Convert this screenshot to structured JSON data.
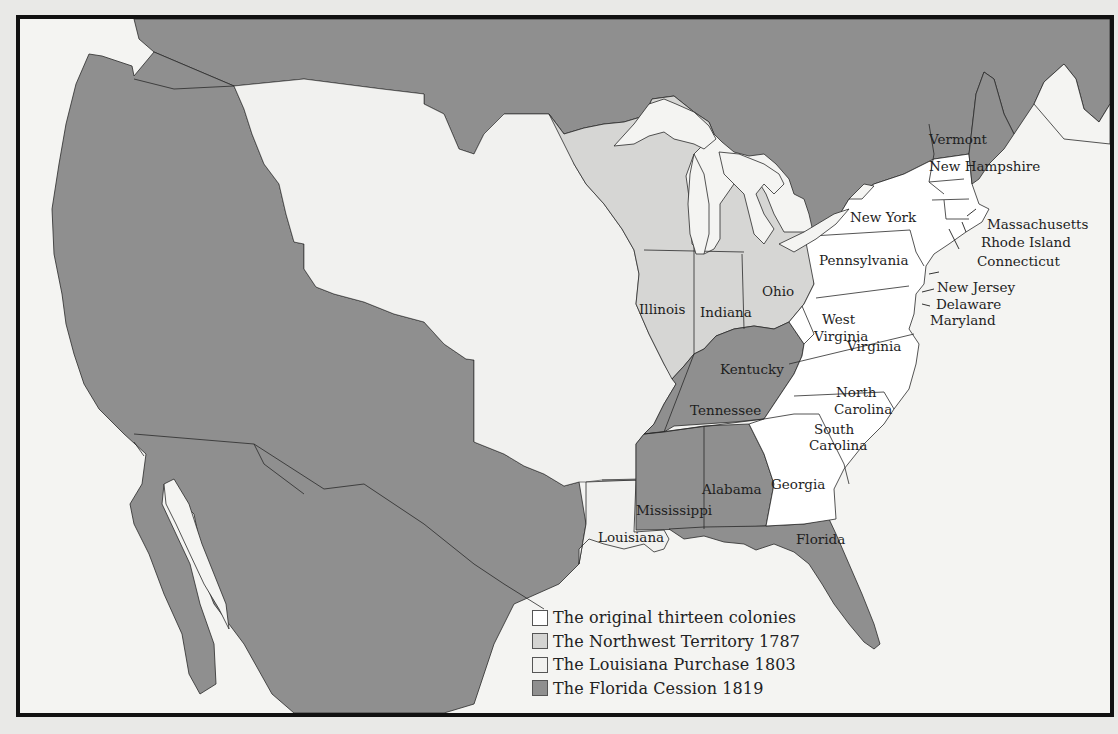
{
  "map": {
    "title": "Territorial expansion of the United States",
    "colors": {
      "original_colonies": "#ffffff",
      "northwest_territory": "#d6d6d4",
      "louisiana_purchase": "#f1f1ef",
      "florida_cession": "#8f8f8f",
      "foreign": "#8f8f8f",
      "water": "#f4f4f2",
      "border": "#2a2a2a"
    },
    "legend": [
      {
        "label": "The original thirteen colonies",
        "color": "#ffffff"
      },
      {
        "label": "The Northwest Territory 1787",
        "color": "#d4d4d2"
      },
      {
        "label": "The Louisiana Purchase 1803",
        "color": "#f1f1ef"
      },
      {
        "label": "The Florida Cession 1819",
        "color": "#8f8f8f"
      }
    ],
    "labels": [
      {
        "text": "Vermont",
        "x": 925,
        "y": 140
      },
      {
        "text": "New Hampshire",
        "x": 925,
        "y": 167
      },
      {
        "text": "New York",
        "x": 828,
        "y": 198
      },
      {
        "text": "Massachusetts",
        "x": 965,
        "y": 208
      },
      {
        "text": "Rhode Island",
        "x": 958,
        "y": 226
      },
      {
        "text": "Connecticut",
        "x": 955,
        "y": 244
      },
      {
        "text": "Pennsylvania",
        "x": 796,
        "y": 243
      },
      {
        "text": "New Jersey",
        "x": 935,
        "y": 270
      },
      {
        "text": "Delaware",
        "x": 932,
        "y": 288
      },
      {
        "text": "Maryland",
        "x": 926,
        "y": 305
      },
      {
        "text": "Illinois",
        "x": 615,
        "y": 294
      },
      {
        "text": "Indiana",
        "x": 674,
        "y": 297
      },
      {
        "text": "Ohio",
        "x": 742,
        "y": 274
      },
      {
        "text": "West",
        "x": 800,
        "y": 303
      },
      {
        "text": "Virginia",
        "x": 790,
        "y": 320
      },
      {
        "text": "Virginia",
        "x": 850,
        "y": 330
      },
      {
        "text": "Kentucky",
        "x": 696,
        "y": 353
      },
      {
        "text": "North",
        "x": 815,
        "y": 378
      },
      {
        "text": "Carolina",
        "x": 810,
        "y": 395
      },
      {
        "text": "Tennessee",
        "x": 665,
        "y": 396
      },
      {
        "text": "South",
        "x": 792,
        "y": 425
      },
      {
        "text": "Carolina",
        "x": 786,
        "y": 441
      },
      {
        "text": "Georgia",
        "x": 748,
        "y": 468
      },
      {
        "text": "Alabama",
        "x": 663,
        "y": 474
      },
      {
        "text": "Mississippi",
        "x": 614,
        "y": 497
      },
      {
        "text": "Louisiana",
        "x": 574,
        "y": 521
      },
      {
        "text": "Florida",
        "x": 793,
        "y": 521
      }
    ]
  }
}
